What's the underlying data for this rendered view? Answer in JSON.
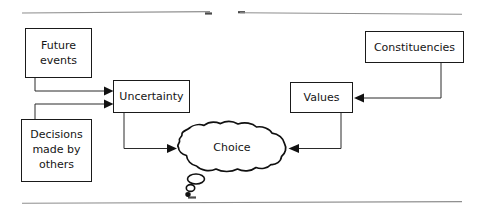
{
  "figure": {
    "type": "flow-diagram",
    "background_color": "#ffffff",
    "line_color": "#1a1a1a",
    "text_color": "#151515",
    "rule_color": "#8e8e8e"
  },
  "nodes": {
    "future_events": {
      "label_line1": "Future",
      "label_line2": "events",
      "shape": "rectangle"
    },
    "decisions_made_by_others": {
      "label_line1": "Decisions",
      "label_line2": "made by",
      "label_line3": "others",
      "shape": "rectangle"
    },
    "uncertainty": {
      "label": "Uncertainty",
      "shape": "rectangle"
    },
    "constituencies": {
      "label": "Constituencies",
      "shape": "rectangle"
    },
    "values": {
      "label": "Values",
      "shape": "rectangle"
    },
    "choice": {
      "label": "Choice",
      "shape": "thought-cloud"
    }
  },
  "edges": [
    {
      "from": "future_events",
      "to": "uncertainty",
      "style": "elbow-arrow"
    },
    {
      "from": "decisions_made_by_others",
      "to": "uncertainty",
      "style": "elbow-arrow"
    },
    {
      "from": "uncertainty",
      "to": "choice",
      "style": "elbow-arrow"
    },
    {
      "from": "constituencies",
      "to": "values",
      "style": "elbow-arrow"
    },
    {
      "from": "values",
      "to": "choice",
      "style": "elbow-arrow"
    }
  ],
  "rules": {
    "top_left_rule": "",
    "top_right_rule": "",
    "bottom_rule": ""
  }
}
